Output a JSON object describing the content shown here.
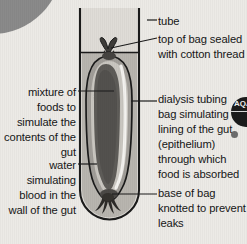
{
  "figure": {
    "background_color": "#eceae6",
    "ink_color": "#161616"
  },
  "labels": {
    "left": [
      {
        "id": "mixture-of-foods",
        "text": "mixture of foods to simulate the contents of the gut",
        "align": "right"
      },
      {
        "id": "water-simulating-blood",
        "text": "water simulating blood in the wall of the gut",
        "align": "right"
      }
    ],
    "right": [
      {
        "id": "tube",
        "text": "tube",
        "align": "left"
      },
      {
        "id": "top-of-bag",
        "text": "top of bag sealed with cotton thread",
        "align": "left"
      },
      {
        "id": "dialysis-tubing-bag",
        "text": "dialysis tubing bag simulating the lining of the gut (epithelium) through which food is absorbed",
        "align": "left"
      },
      {
        "id": "base-of-bag",
        "text": "base of bag knotted to prevent leaks",
        "align": "left"
      }
    ]
  },
  "diagram": {
    "parts": [
      {
        "id": "test-tube",
        "name": "tube",
        "fill": "#dedbd6",
        "stroke": "#1b1b1b"
      },
      {
        "id": "water",
        "name": "water simulating blood in the wall of the gut",
        "fill": "#b4b1ab"
      },
      {
        "id": "water-surface-line",
        "name": "water level",
        "stroke": "#1b1b1b"
      },
      {
        "id": "dialysis-bag",
        "name": "dialysis tubing bag",
        "fill": "#9e9b96",
        "stroke": "#1b1b1b"
      },
      {
        "id": "food-mixture",
        "name": "mixture of foods",
        "fill": "#5c5a57"
      },
      {
        "id": "top-knot",
        "name": "top of bag sealed with cotton thread",
        "fill": "#4a4845"
      },
      {
        "id": "base-knot",
        "name": "base of bag knotted to prevent leaks",
        "fill": "#3e3c3a"
      }
    ]
  },
  "badge": {
    "text": "AQA",
    "color": "#1b1b1b"
  }
}
